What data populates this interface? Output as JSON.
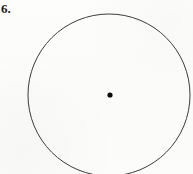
{
  "figure": {
    "problem_number": "6.",
    "background_color": "#fcfcfb",
    "stroke_color": "#3c3c3c",
    "point_color": "#0d0d0d",
    "center_point_label": "",
    "shapes": [
      {
        "name": "circle-outline",
        "type": "circle",
        "cx": 109,
        "cy": 95,
        "r": 81,
        "stroke_width": 1,
        "fill": "none",
        "clipped_at_bottom": true
      },
      {
        "name": "center-point",
        "type": "point",
        "cx": 110,
        "cy": 95,
        "r": 2.6,
        "fill": "#0d0d0d"
      }
    ]
  }
}
